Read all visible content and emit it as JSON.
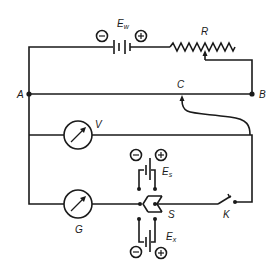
{
  "diagram": {
    "type": "potentiometer-circuit",
    "labels": {
      "working_battery": "E",
      "working_battery_sub": "w",
      "rheostat": "R",
      "node_a": "A",
      "node_b": "B",
      "slider_contact": "C",
      "voltmeter": "V",
      "galvanometer": "G",
      "standard_cell": "E",
      "standard_cell_sub": "s",
      "unknown_emf": "E",
      "unknown_emf_sub": "x",
      "selector_switch": "S",
      "key": "K"
    },
    "polarity": {
      "minus": "−",
      "plus": "+"
    },
    "colors": {
      "stroke": "#1a1a1a",
      "background": "#ffffff"
    }
  }
}
